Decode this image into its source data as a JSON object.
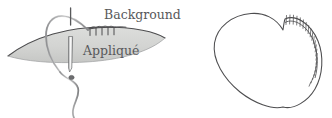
{
  "figure": {
    "background_color": "#ffffff",
    "width": 332,
    "height": 118
  },
  "labels": {
    "background": "Background",
    "applique": "Appliqué"
  },
  "colors": {
    "ink": "#58595b",
    "line": "#4d4d4f",
    "applique_fill": "#d6d7d5",
    "applique_fill_dark": "#c3c4c2",
    "thread": "#6d6e70",
    "needle_fill": "#f2f2f2",
    "page": "#ffffff"
  },
  "panels": [
    {
      "name": "stitch-detail-panel",
      "description": "Needle and thread passing through an appliqué patch laid on background fabric",
      "elements": [
        "background-fabric-line",
        "applique-patch",
        "needle",
        "thread-loop",
        "thread-tail",
        "thread-knot",
        "stitch-row"
      ],
      "stitch_count": 4
    },
    {
      "name": "heart-panel",
      "description": "Heart-shaped appliqué with stitching along the upper right lobe",
      "elements": [
        "heart-outline",
        "heart-stitch-line",
        "heart-stitch-ticks"
      ],
      "stitch_count": 22
    }
  ]
}
